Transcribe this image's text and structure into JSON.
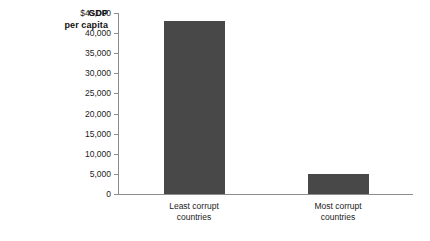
{
  "chart_data": {
    "type": "bar",
    "title": "",
    "xlabel": "",
    "ylabel": "GDP per capita",
    "ylabel_line1": "GDP",
    "ylabel_line2": "per capita",
    "categories": [
      "Least corrupt countries",
      "Most corrupt countries"
    ],
    "category_lines": [
      [
        "Least corrupt",
        "countries"
      ],
      [
        "Most corrupt",
        "countries"
      ]
    ],
    "values": [
      43000,
      5000
    ],
    "ylim": [
      0,
      45000
    ],
    "yticks": [
      0,
      5000,
      10000,
      15000,
      20000,
      25000,
      30000,
      35000,
      40000,
      45000
    ],
    "ytick_labels": [
      "0",
      "5,000",
      "10,000",
      "15,000",
      "20,000",
      "25,000",
      "30,000",
      "35,000",
      "40,000",
      "$45,000"
    ],
    "grid": false,
    "legend": null,
    "bar_color": "#484848",
    "axis_color": "#8d8d8d",
    "background": "#ffffff"
  }
}
